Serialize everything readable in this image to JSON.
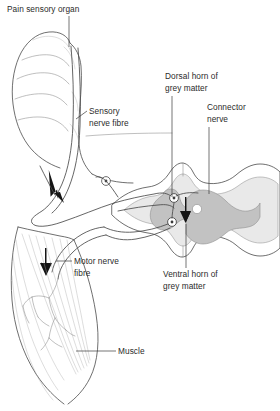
{
  "diagram": {
    "background_color": "#ffffff",
    "line_color": "#4a4a4a",
    "labels": {
      "pain_sensory_organ": "Pain sensory organ",
      "sensory_nerve_fibre_l1": "Sensory",
      "sensory_nerve_fibre_l2": "nerve fibre",
      "dorsal_horn_l1": "Dorsal horn of",
      "dorsal_horn_l2": "grey matter",
      "connector_nerve_l1": "Connector",
      "connector_nerve_l2": "nerve",
      "ventral_horn_l1": "Ventral horn of",
      "ventral_horn_l2": "grey matter",
      "motor_nerve_fibre_l1": "Motor nerve",
      "motor_nerve_fibre_l2": "fibre",
      "muscle": "Muscle"
    },
    "structures": {
      "finger": "finger-fingertip",
      "muscle_belly": "muscle-belly",
      "spinal_cord": "spinal-cord-cross-section",
      "grey_matter": "butterfly-grey-matter",
      "white_matter": "white-matter",
      "central_canal": "central-canal",
      "dorsal_root_ganglion": "dorsal-root-ganglion-cell-body",
      "connector_neuron_body": "connector-neuron-cell-body",
      "motor_neuron_body": "motor-neuron-cell-body"
    },
    "colors": {
      "grey_matter": "#c4c4c4",
      "white_matter": "#e6e6e6",
      "outer_sheath": "#f2f2f2",
      "central_canal": "#ffffff",
      "text": "#2b2b2b",
      "stroke": "#4a4a4a"
    },
    "flow_arrows": [
      {
        "name": "sensory-signal-arrow",
        "direction": "toward-spinal-cord"
      },
      {
        "name": "interneuron-arrow",
        "direction": "dorsal-to-ventral"
      },
      {
        "name": "motor-signal-arrow",
        "direction": "toward-muscle"
      }
    ]
  }
}
